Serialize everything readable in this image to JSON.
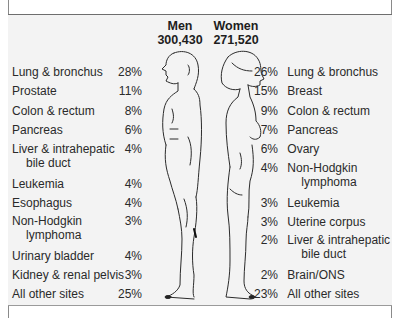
{
  "header": {
    "men": {
      "title": "Men",
      "count": "300,430"
    },
    "women": {
      "title": "Women",
      "count": "271,520"
    }
  },
  "men_sites": [
    {
      "label": "Lung & bronchus",
      "label2": "",
      "pct": "28%"
    },
    {
      "label": "Prostate",
      "label2": "",
      "pct": "11%"
    },
    {
      "label": "Colon & rectum",
      "label2": "",
      "pct": "8%"
    },
    {
      "label": "Pancreas",
      "label2": "",
      "pct": "6%"
    },
    {
      "label": "Liver & intrahepatic",
      "label2": "bile duct",
      "pct": "4%"
    },
    {
      "label": "Leukemia",
      "label2": "",
      "pct": "4%"
    },
    {
      "label": "Esophagus",
      "label2": "",
      "pct": "4%"
    },
    {
      "label": "Non-Hodgkin",
      "label2": "lymphoma",
      "pct": "3%"
    },
    {
      "label": "Urinary bladder",
      "label2": "",
      "pct": "4%"
    },
    {
      "label": "Kidney & renal pelvis",
      "label2": "",
      "pct": "3%"
    },
    {
      "label": "All other sites",
      "label2": "",
      "pct": "25%"
    }
  ],
  "women_sites": [
    {
      "label": "Lung & bronchus",
      "label2": "",
      "pct": "26%"
    },
    {
      "label": "Breast",
      "label2": "",
      "pct": "15%"
    },
    {
      "label": "Colon & rectum",
      "label2": "",
      "pct": "9%"
    },
    {
      "label": "Pancreas",
      "label2": "",
      "pct": "7%"
    },
    {
      "label": "Ovary",
      "label2": "",
      "pct": "6%"
    },
    {
      "label": "Non-Hodgkin",
      "label2": "lymphoma",
      "pct": "4%"
    },
    {
      "label": "Leukemia",
      "label2": "",
      "pct": "3%"
    },
    {
      "label": "Uterine corpus",
      "label2": "",
      "pct": "3%"
    },
    {
      "label": "Liver & intrahepatic",
      "label2": "bile duct",
      "pct": "2%"
    },
    {
      "label": "Brain/ONS",
      "label2": "",
      "pct": "2%"
    },
    {
      "label": "All other sites",
      "label2": "",
      "pct": "23%"
    }
  ],
  "figures": {
    "men_icon": "male-figure-profile",
    "women_icon": "female-figure-profile"
  },
  "colors": {
    "panel_bg": "#f3f3f3",
    "text": "#2a2a2a",
    "border": "#6e6e6e"
  }
}
